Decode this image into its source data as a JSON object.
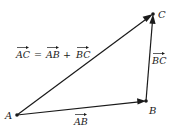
{
  "diagram": {
    "type": "vector-triangle",
    "points": {
      "A": {
        "label": "A",
        "x": 17,
        "y": 115
      },
      "B": {
        "label": "B",
        "x": 146,
        "y": 101
      },
      "C": {
        "label": "C",
        "x": 153,
        "y": 14
      }
    },
    "vectors": [
      {
        "name": "AB",
        "from": "A",
        "to": "B",
        "label": "AB"
      },
      {
        "name": "BC",
        "from": "B",
        "to": "C",
        "label": "BC"
      },
      {
        "name": "AC",
        "from": "A",
        "to": "C",
        "label": "AC"
      }
    ],
    "equation": {
      "lhs": "AC",
      "equals": "=",
      "term1": "AB",
      "plus": "+",
      "term2": "BC"
    },
    "colors": {
      "ink": "#1a1a1a",
      "background": "#ffffff"
    }
  }
}
